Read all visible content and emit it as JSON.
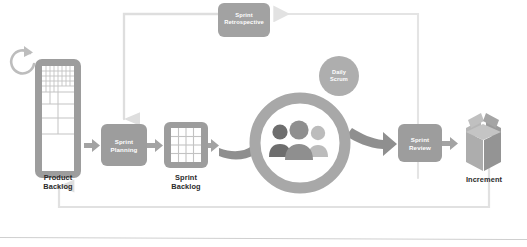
{
  "diagram": {
    "background_color": "#ffffff",
    "baseline_rule_color": "#c9c9c9"
  },
  "colors": {
    "node_fill": "#9a9a9a",
    "node_fill_light": "#b4b4b4",
    "arrow_gray": "#a0a0a0",
    "arrow_faint": "#dedede",
    "ring_gray": "#a8a8a8",
    "label_text": "#2b2b2b",
    "box_text": "#ffffff",
    "person_dark": "#6e6e6e",
    "person_mid": "#8f8f8f",
    "person_light": "#b9b9b9",
    "increment_box": "#a4a4a4"
  },
  "nodes": {
    "product_backlog": {
      "label": "Product\nBacklog",
      "icon": "backlog-list-icon"
    },
    "sprint_planning": {
      "label": "Sprint\nPlanning",
      "shape": "rounded-box"
    },
    "sprint_backlog": {
      "label": "Sprint\nBacklog",
      "icon": "grid-board-icon"
    },
    "sprint_cycle": {
      "label": "",
      "icon": "ring-cycle-icon",
      "team_icon": "scrum-team-icon"
    },
    "daily_scrum": {
      "label": "Daily\nScrum",
      "shape": "circle"
    },
    "sprint_review": {
      "label": "Sprint\nReview",
      "shape": "rounded-box"
    },
    "sprint_retrospective": {
      "label": "Sprint\nRetrospective",
      "shape": "rounded-box"
    },
    "increment": {
      "label": "Increment",
      "icon": "open-box-icon"
    },
    "refresh": {
      "label": "",
      "icon": "refresh-cycle-icon"
    }
  },
  "connectors": [
    {
      "name": "product-backlog-to-sprint-planning",
      "from": "product_backlog",
      "to": "sprint_planning",
      "style": "solid-arrow"
    },
    {
      "name": "sprint-planning-to-sprint-backlog",
      "from": "sprint_planning",
      "to": "sprint_backlog",
      "style": "solid-arrow"
    },
    {
      "name": "sprint-backlog-to-sprint-cycle",
      "from": "sprint_backlog",
      "to": "sprint_cycle",
      "style": "solid-arrow"
    },
    {
      "name": "sprint-cycle-to-sprint-review",
      "from": "sprint_cycle",
      "to": "sprint_review",
      "style": "curved-arrow"
    },
    {
      "name": "sprint-review-to-increment",
      "from": "sprint_review",
      "to": "increment",
      "style": "solid-arrow"
    },
    {
      "name": "sprint-review-to-sprint-retrospective",
      "from": "sprint_review",
      "to": "sprint_retrospective",
      "style": "faint-elbow-arrow"
    },
    {
      "name": "sprint-retrospective-to-sprint-planning",
      "from": "sprint_retrospective",
      "to": "sprint_planning",
      "style": "faint-elbow-arrow"
    },
    {
      "name": "increment-to-product-backlog",
      "from": "increment",
      "to": "product_backlog",
      "style": "faint-elbow-arrow"
    }
  ]
}
